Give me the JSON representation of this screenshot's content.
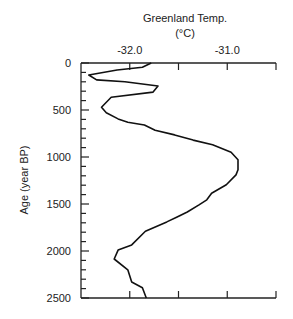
{
  "chart_data": {
    "type": "line",
    "title": "Greenland Temp.",
    "title_unit": "(°C)",
    "xlabel": "Greenland Temp. (°C)",
    "ylabel": "Age (year BP)",
    "x_axis_position": "top",
    "y_inverted": true,
    "xlim": [
      -32.5,
      -30.5
    ],
    "ylim": [
      0,
      2500
    ],
    "x_ticks": [
      -32.0,
      -31.5,
      -31.0
    ],
    "x_tick_labels": [
      "-32.0",
      "-31.0"
    ],
    "x_tick_label_values": [
      -32.0,
      -31.0
    ],
    "y_ticks": [
      0,
      500,
      1000,
      1500,
      2000,
      2500
    ],
    "y_tick_labels": [
      "0",
      "500",
      "1000",
      "1500",
      "2000",
      "2500"
    ],
    "y_minor_tick_step": 100,
    "grid": false,
    "legend": "none",
    "series": [
      {
        "name": "Greenland Temp.",
        "points": [
          {
            "age": 0,
            "temp": -31.78
          },
          {
            "age": 45,
            "temp": -31.87
          },
          {
            "age": 75,
            "temp": -32.13
          },
          {
            "age": 128,
            "temp": -32.42
          },
          {
            "age": 180,
            "temp": -32.34
          },
          {
            "age": 200,
            "temp": -32.05
          },
          {
            "age": 245,
            "temp": -31.71
          },
          {
            "age": 310,
            "temp": -31.76
          },
          {
            "age": 365,
            "temp": -32.19
          },
          {
            "age": 470,
            "temp": -32.29
          },
          {
            "age": 530,
            "temp": -32.24
          },
          {
            "age": 595,
            "temp": -32.12
          },
          {
            "age": 630,
            "temp": -32.02
          },
          {
            "age": 660,
            "temp": -31.85
          },
          {
            "age": 715,
            "temp": -31.74
          },
          {
            "age": 765,
            "temp": -31.54
          },
          {
            "age": 820,
            "temp": -31.35
          },
          {
            "age": 870,
            "temp": -31.15
          },
          {
            "age": 950,
            "temp": -30.96
          },
          {
            "age": 1030,
            "temp": -30.89
          },
          {
            "age": 1135,
            "temp": -30.89
          },
          {
            "age": 1190,
            "temp": -30.91
          },
          {
            "age": 1295,
            "temp": -31.01
          },
          {
            "age": 1385,
            "temp": -31.16
          },
          {
            "age": 1455,
            "temp": -31.21
          },
          {
            "age": 1510,
            "temp": -31.29
          },
          {
            "age": 1585,
            "temp": -31.41
          },
          {
            "age": 1640,
            "temp": -31.52
          },
          {
            "age": 1690,
            "temp": -31.62
          },
          {
            "age": 1790,
            "temp": -31.84
          },
          {
            "age": 1935,
            "temp": -31.98
          },
          {
            "age": 1990,
            "temp": -32.12
          },
          {
            "age": 2085,
            "temp": -32.16
          },
          {
            "age": 2200,
            "temp": -32.02
          },
          {
            "age": 2330,
            "temp": -31.98
          },
          {
            "age": 2390,
            "temp": -31.87
          },
          {
            "age": 2500,
            "temp": -31.83
          }
        ]
      }
    ]
  }
}
